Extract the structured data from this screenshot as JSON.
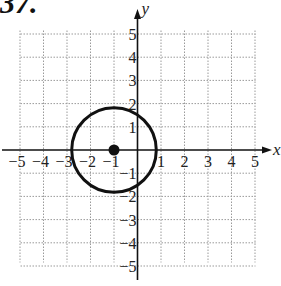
{
  "problem": {
    "number": "37."
  },
  "graph": {
    "x_label": "x",
    "y_label": "y",
    "x_ticks": [
      "−5",
      "−4",
      "−3",
      "−2",
      "−1",
      "1",
      "2",
      "3",
      "4",
      "5"
    ],
    "y_ticks": [
      "5",
      "4",
      "3",
      "2",
      "1",
      "−1",
      "−2",
      "−3",
      "−4",
      "−5"
    ],
    "range": {
      "xmin": -5,
      "xmax": 5,
      "ymin": -5,
      "ymax": 5
    },
    "grid": "dotted",
    "circle": {
      "center": [
        -1,
        0
      ],
      "radius": 1.8,
      "stroke": "#111111"
    },
    "center_point": [
      -1,
      0
    ]
  }
}
